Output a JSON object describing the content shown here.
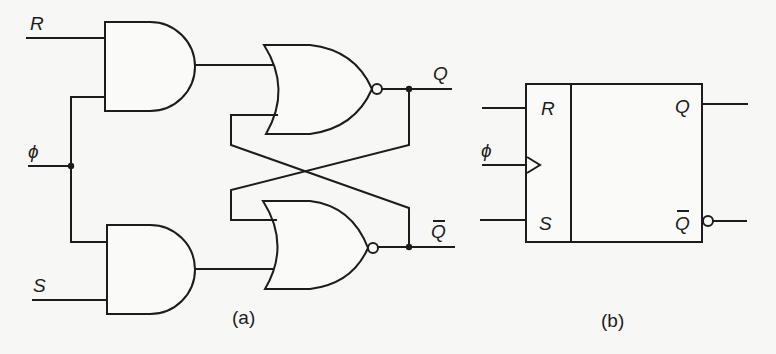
{
  "figure": {
    "panel_a": {
      "caption": "(a)",
      "description": "Clocked RS flip-flop: two AND gates gating R and S with clock, feeding cross-coupled NOR latch",
      "inputs": {
        "r": "R",
        "clock": "ϕ",
        "s": "S"
      },
      "outputs": {
        "q": "Q",
        "q_bar": "Q"
      },
      "gates": [
        {
          "type": "AND",
          "inputs": [
            "R",
            "ϕ"
          ]
        },
        {
          "type": "AND",
          "inputs": [
            "ϕ",
            "S"
          ]
        },
        {
          "type": "NOR",
          "output": "Q"
        },
        {
          "type": "NOR",
          "output": "Q̄"
        }
      ]
    },
    "panel_b": {
      "caption": "(b)",
      "description": "Block symbol of clocked RS flip-flop",
      "inputs": {
        "r": "R",
        "clock": "ϕ",
        "s": "S"
      },
      "outputs": {
        "q": "Q",
        "q_bar": "Q"
      }
    }
  }
}
